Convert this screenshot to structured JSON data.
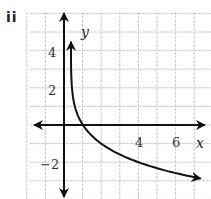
{
  "panel_label": "ii",
  "chart_data": {
    "type": "line",
    "title": "",
    "xlabel": "x",
    "ylabel": "y",
    "xlim": [
      -2,
      7.5
    ],
    "ylim": [
      -4,
      6
    ],
    "grid": true,
    "x_tick_labels": [
      "4",
      "6"
    ],
    "y_tick_labels": [
      "4",
      "2",
      "-2"
    ],
    "series": [
      {
        "name": "y = -log2(x)",
        "x": [
          0.05,
          0.0625,
          0.125,
          0.25,
          0.5,
          1,
          2,
          4,
          7.5
        ],
        "y": [
          4.32,
          4,
          3,
          2,
          1,
          0,
          -1,
          -2,
          -2.91
        ]
      }
    ],
    "annotations": [
      "curve has arrowheads at both ends",
      "vertical asymptote at x = 0"
    ]
  },
  "colors": {
    "grid": "#c8c8c8",
    "axis": "#111111",
    "curve": "#111111"
  }
}
